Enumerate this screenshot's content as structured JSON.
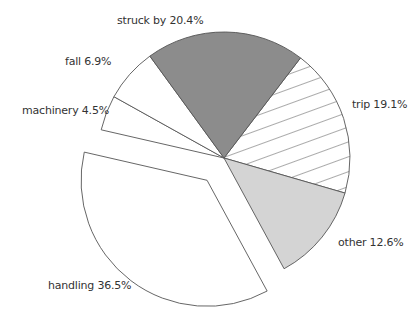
{
  "chart_data": {
    "type": "pie",
    "title": "",
    "exploded": "handling",
    "slices": [
      {
        "label": "trip",
        "value": 19.1,
        "display": "trip 19.1%",
        "fill": "hatch",
        "color": "#ffffff"
      },
      {
        "label": "other",
        "value": 12.6,
        "display": "other 12.6%",
        "fill": "solid",
        "color": "#d4d4d4"
      },
      {
        "label": "handling",
        "value": 36.5,
        "display": "handling 36.5%",
        "fill": "solid",
        "color": "#ffffff"
      },
      {
        "label": "machinery",
        "value": 4.5,
        "display": "machinery 4.5%",
        "fill": "solid",
        "color": "#ffffff"
      },
      {
        "label": "fall",
        "value": 6.9,
        "display": "fall 6.9%",
        "fill": "solid",
        "color": "#ffffff"
      },
      {
        "label": "struck by",
        "value": 20.4,
        "display": "struck by 20.4%",
        "fill": "solid",
        "color": "#8c8c8c"
      }
    ],
    "stroke_color": "#555555"
  }
}
